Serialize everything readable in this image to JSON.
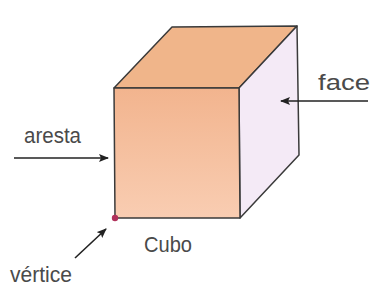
{
  "diagram": {
    "title": "Cubo",
    "labels": {
      "face": "face",
      "aresta": "aresta",
      "vertice": "vértice",
      "cubo": "Cubo"
    },
    "colors": {
      "top_face": "#F0B58A",
      "front_face_top": "#F2B48E",
      "front_face_bottom": "#F9CDB2",
      "side_face": "#F4EAF6",
      "edge": "#3a3a3a",
      "vertex_dot": "#B0305A",
      "label_text": "#4a4a4a",
      "arrow": "#222222"
    },
    "vertices": {
      "front_top_left": [
        114,
        88
      ],
      "front_top_right": [
        239,
        88
      ],
      "front_bottom_left": [
        115,
        218
      ],
      "front_bottom_right": [
        240,
        218
      ],
      "back_top_left": [
        172,
        27
      ],
      "back_top_right": [
        297,
        26
      ],
      "back_bottom_right": [
        299,
        155
      ]
    }
  }
}
